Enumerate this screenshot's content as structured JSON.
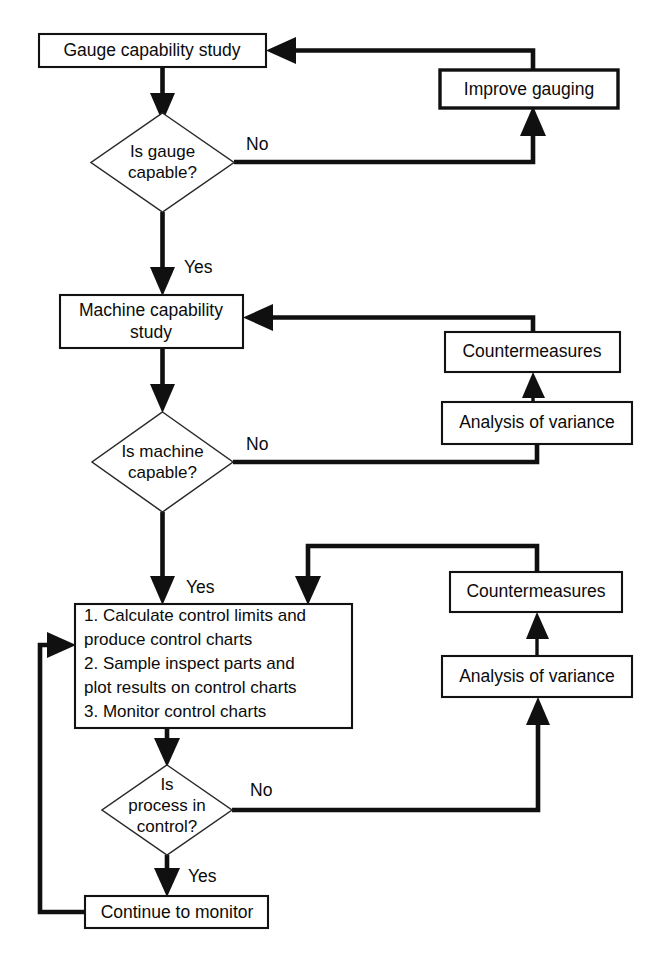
{
  "diagram": {
    "background_color": "#ffffff",
    "line_color": "#101010",
    "text_color": "#0b0b0b",
    "width": 661,
    "height": 956
  },
  "nodes": {
    "gauge_study": {
      "label": "Gauge capability study",
      "shape": "process"
    },
    "improve_gauging": {
      "label": "Improve gauging",
      "shape": "process"
    },
    "gauge_decision": {
      "line1": "Is gauge",
      "line2": "capable?",
      "shape": "decision"
    },
    "machine_study": {
      "line1": "Machine capability",
      "line2": "study",
      "shape": "process"
    },
    "countermeasures_1": {
      "label": "Countermeasures",
      "shape": "process"
    },
    "analysis_1": {
      "label": "Analysis of variance",
      "shape": "process"
    },
    "machine_decision": {
      "line1": "Is machine",
      "line2": "capable?",
      "shape": "decision"
    },
    "control_steps": {
      "shape": "process",
      "lines": [
        "1. Calculate control limits and",
        "produce control charts",
        "2. Sample inspect parts and",
        "plot results on control charts",
        "3. Monitor control charts"
      ]
    },
    "countermeasures_2": {
      "label": "Countermeasures",
      "shape": "process"
    },
    "analysis_2": {
      "label": "Analysis of variance",
      "shape": "process"
    },
    "process_decision": {
      "line1": "Is",
      "line2": "process in",
      "line3": "control?",
      "shape": "decision"
    },
    "continue_monitor": {
      "label": "Continue to monitor",
      "shape": "process"
    }
  },
  "edge_labels": {
    "gauge_no": "No",
    "gauge_yes": "Yes",
    "machine_no": "No",
    "machine_yes": "Yes",
    "process_no": "No",
    "process_yes": "Yes"
  }
}
